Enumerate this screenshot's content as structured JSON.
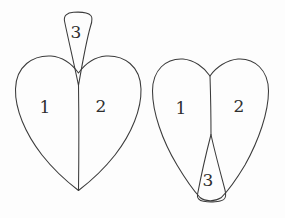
{
  "figure": {
    "background_color": "#fdfdfd",
    "stroke_color": "#3b3b3b",
    "label_color": "#2e2e2e",
    "shapes": [
      {
        "id": "left-heart",
        "name": "heart-with-upward-spike",
        "regions": [
          {
            "id": "left-region-1",
            "label": "1",
            "position": "left lobe"
          },
          {
            "id": "left-region-2",
            "label": "2",
            "position": "right lobe"
          },
          {
            "id": "left-region-3",
            "label": "3",
            "position": "upward spike above cleft"
          }
        ]
      },
      {
        "id": "right-heart",
        "name": "heart-with-downward-wedge",
        "regions": [
          {
            "id": "right-region-1",
            "label": "1",
            "position": "left lobe"
          },
          {
            "id": "right-region-2",
            "label": "2",
            "position": "right lobe"
          },
          {
            "id": "right-region-3",
            "label": "3",
            "position": "downward wedge at bottom"
          }
        ]
      }
    ]
  }
}
